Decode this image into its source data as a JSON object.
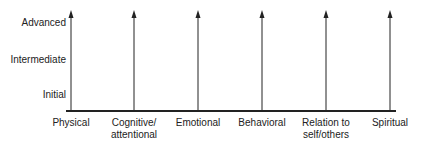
{
  "diagram": {
    "y_levels": [
      {
        "label": "Advanced",
        "y": 23
      },
      {
        "label": "Intermediate",
        "y": 60
      },
      {
        "label": "Initial",
        "y": 95
      }
    ],
    "dimensions": [
      {
        "label": "Physical",
        "x": 71
      },
      {
        "label": "Cognitive/\nattentional",
        "x": 134
      },
      {
        "label": "Emotional",
        "x": 198
      },
      {
        "label": "Behavioral",
        "x": 262
      },
      {
        "label": "Relation to\nself/others",
        "x": 326
      },
      {
        "label": "Spiritual",
        "x": 390
      }
    ],
    "line_color": "#222222"
  }
}
